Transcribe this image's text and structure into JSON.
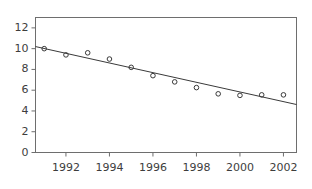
{
  "chart_data": {
    "type": "scatter",
    "title": "",
    "subtitle": "",
    "xlabel": "",
    "ylabel": "",
    "xlim": [
      1990.6,
      2002.6
    ],
    "ylim": [
      0,
      13
    ],
    "grid": false,
    "legend": null,
    "x": [
      1991,
      1992,
      1993,
      1994,
      1995,
      1996,
      1997,
      1998,
      1999,
      2000,
      2001,
      2002
    ],
    "values": [
      10.0,
      9.4,
      9.6,
      9.0,
      8.2,
      7.4,
      6.8,
      6.25,
      5.65,
      5.5,
      5.55,
      5.55
    ],
    "series": [
      {
        "name": "observations",
        "type": "scatter",
        "marker": "open-circle",
        "values": [
          10.0,
          9.4,
          9.6,
          9.0,
          8.2,
          7.4,
          6.8,
          6.25,
          5.65,
          5.5,
          5.55,
          5.55
        ]
      },
      {
        "name": "fitted-trend-line",
        "type": "line",
        "endpoints": [
          {
            "x": 1990.6,
            "y": 10.2
          },
          {
            "x": 2002.6,
            "y": 4.62
          }
        ]
      }
    ],
    "x_ticks": [
      1992,
      1994,
      1996,
      1998,
      2000,
      2002
    ],
    "x_tick_labels": [
      "1992",
      "1994",
      "1996",
      "1998",
      "2000",
      "2002"
    ],
    "y_ticks": [
      0,
      2,
      4,
      6,
      8,
      10,
      12
    ],
    "y_tick_labels": [
      "0",
      "2",
      "4",
      "6",
      "8",
      "10",
      "12"
    ],
    "colors": {
      "axis": "#6e6e6e",
      "marker": "#3a3a3a",
      "line": "#3a3a3a",
      "text": "#3d3d3d",
      "background": "#ffffff"
    }
  }
}
